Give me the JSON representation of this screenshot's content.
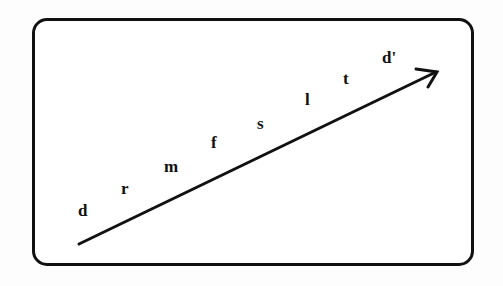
{
  "diagram": {
    "type": "arrow-with-labels",
    "labels": [
      "d",
      "r",
      "m",
      "f",
      "s",
      "l",
      "t",
      "d'"
    ],
    "label_positions": [
      {
        "x": 78,
        "y": 202
      },
      {
        "x": 121,
        "y": 180
      },
      {
        "x": 164,
        "y": 158
      },
      {
        "x": 210,
        "y": 134
      },
      {
        "x": 257,
        "y": 115
      },
      {
        "x": 305,
        "y": 92
      },
      {
        "x": 343,
        "y": 70
      },
      {
        "x": 381,
        "y": 49
      }
    ],
    "arrow": {
      "x1": 79,
      "y1": 244,
      "x2": 437,
      "y2": 72
    },
    "stroke_color": "#111111"
  }
}
